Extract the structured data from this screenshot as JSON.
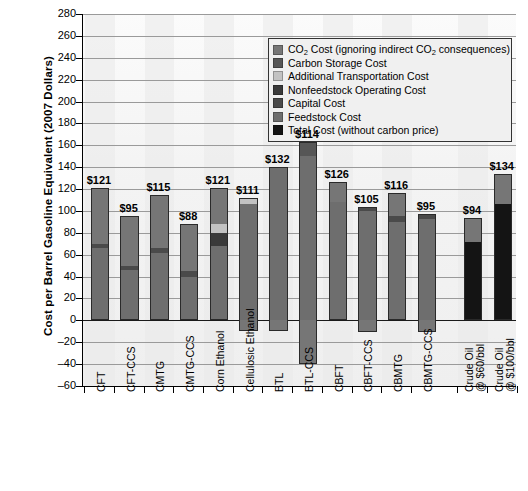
{
  "chart_data": {
    "type": "bar",
    "title": "",
    "xlabel": "",
    "ylabel": "Cost per Barrel Gasoline Equivalent (2007 Dollars)",
    "ylim": [
      -60,
      280
    ],
    "ytick_step": 20,
    "yticks": [
      280,
      260,
      240,
      220,
      200,
      180,
      160,
      140,
      120,
      100,
      80,
      60,
      40,
      20,
      0,
      -20,
      -40,
      -60
    ],
    "grid": true,
    "legend_position": "top-right",
    "stacked": true,
    "categories": [
      "CFT",
      "CFT-CCS",
      "CMTG",
      "CMTG-CCS",
      "Corn Ethanol",
      "Cellulosic Ethanol",
      "BTL",
      "BTL-CCS",
      "CBFT",
      "CBFT-CCS",
      "CBMTG",
      "CBMTG-CCS",
      "Crude Oil\n@ $60/bbl",
      "Crude Oil\n@ $100/bbl"
    ],
    "value_labels": [
      "$121",
      "$95",
      "$115",
      "$88",
      "$121",
      "$111",
      "$132",
      "$114",
      "$126",
      "$105",
      "$116",
      "$95",
      "$94",
      "$134"
    ],
    "values": [
      121,
      95,
      115,
      88,
      121,
      111,
      132,
      114,
      126,
      105,
      116,
      95,
      94,
      134
    ],
    "series": [
      {
        "name": "Feedstock Cost",
        "color": "#6e6e6e",
        "values": [
          66,
          46,
          62,
          40,
          68,
          106,
          140,
          150,
          108,
          100,
          90,
          93,
          0,
          0
        ]
      },
      {
        "name": "Capital Cost",
        "color": "#4a4a4a",
        "values": [
          4,
          4,
          4,
          5,
          0,
          0,
          0,
          0,
          0,
          4,
          5,
          4,
          0,
          0
        ]
      },
      {
        "name": "Nonfeedstock Operating Cost",
        "color": "#3a3a3a",
        "values": [
          0,
          0,
          0,
          0,
          12,
          0,
          0,
          0,
          0,
          0,
          0,
          0,
          0,
          0
        ]
      },
      {
        "name": "Additional Transportation Cost",
        "color": "#c2c2c2",
        "values": [
          0,
          0,
          0,
          0,
          8,
          6,
          0,
          0,
          0,
          0,
          0,
          0,
          0,
          0
        ]
      },
      {
        "name": "Carbon Storage Cost",
        "color": "#565656",
        "values": [
          0,
          0,
          0,
          0,
          0,
          0,
          0,
          13,
          0,
          0,
          0,
          0,
          0,
          0
        ]
      },
      {
        "name": "CO₂ Cost (ignoring indirect CO₂ consequences)",
        "color": "#767676",
        "values": [
          51,
          45,
          49,
          43,
          33,
          0,
          0,
          0,
          18,
          0,
          21,
          0,
          22,
          28
        ]
      },
      {
        "name": "Total Cost (without carbon price)",
        "color": "#141414",
        "values": [
          0,
          0,
          0,
          0,
          0,
          0,
          0,
          0,
          0,
          0,
          0,
          0,
          72,
          106
        ]
      }
    ],
    "negative_segments": [
      {
        "category": "Cellulosic Ethanol",
        "value": -10,
        "series": "CO₂ Cost (ignoring indirect CO₂ consequences)"
      },
      {
        "category": "BTL",
        "value": -10,
        "series": "CO₂ Cost (ignoring indirect CO₂ consequences)"
      },
      {
        "category": "BTL-CCS",
        "value": -40,
        "series": "CO₂ Cost (ignoring indirect CO₂ consequences)"
      },
      {
        "category": "CFT-CCS",
        "value": 0,
        "series": ""
      },
      {
        "category": "CBFT-CCS",
        "value": -11,
        "series": "CO₂ Cost (ignoring indirect CO₂ consequences)"
      },
      {
        "category": "CBMTG-CCS",
        "value": -11,
        "series": "CO₂ Cost (ignoring indirect CO₂ consequences)"
      }
    ]
  },
  "legend": {
    "items": [
      {
        "label": "CO₂ Cost (ignoring indirect CO₂ consequences)",
        "color": "#767676"
      },
      {
        "label": "Carbon Storage Cost",
        "color": "#565656"
      },
      {
        "label": "Additional Transportation Cost",
        "color": "#c2c2c2"
      },
      {
        "label": "Nonfeedstock Operating Cost",
        "color": "#3a3a3a"
      },
      {
        "label": "Capital Cost",
        "color": "#4a4a4a"
      },
      {
        "label": "Feedstock Cost",
        "color": "#6e6e6e"
      },
      {
        "label": "Total Cost (without carbon price)",
        "color": "#141414"
      }
    ]
  },
  "axis": {
    "y_title": "Cost per Barrel Gasoline Equivalent (2007 Dollars)"
  }
}
